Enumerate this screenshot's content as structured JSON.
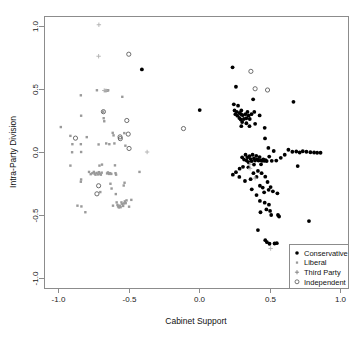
{
  "chart_data": {
    "type": "scatter",
    "title": "",
    "xlabel": "Cabinet Support",
    "ylabel": "Intra-Party Division",
    "xlim": [
      -1.15,
      1.15
    ],
    "ylim": [
      -1.15,
      1.08
    ],
    "grid": false,
    "xticks": [
      -1.0,
      -0.5,
      0.0,
      0.5,
      1.0
    ],
    "xticklabels": [
      "-1.0",
      "-0.5",
      "0.0",
      "0.5",
      "1.0"
    ],
    "yticks": [
      1.0,
      0.5,
      0.0,
      -0.5,
      -1.0
    ],
    "yticklabels": [
      "1.0",
      "0.5",
      "0.0",
      "-0.5",
      "-1.0"
    ],
    "legend_position": "lower right",
    "series": [
      {
        "name": "Conservative",
        "marker": "filled-circle",
        "color": "#000000",
        "points": [
          [
            -0.405,
            0.655
          ],
          [
            0.005,
            0.333
          ],
          [
            0.238,
            0.672
          ],
          [
            0.262,
            0.518
          ],
          [
            0.247,
            0.378
          ],
          [
            0.277,
            0.368
          ],
          [
            0.252,
            0.33
          ],
          [
            0.268,
            0.318
          ],
          [
            0.258,
            0.3
          ],
          [
            0.272,
            0.288
          ],
          [
            0.288,
            0.31
          ],
          [
            0.3,
            0.33
          ],
          [
            0.298,
            0.3
          ],
          [
            0.286,
            0.27
          ],
          [
            0.296,
            0.258
          ],
          [
            0.31,
            0.292
          ],
          [
            0.318,
            0.262
          ],
          [
            0.306,
            0.238
          ],
          [
            0.33,
            0.3
          ],
          [
            0.344,
            0.318
          ],
          [
            0.352,
            0.288
          ],
          [
            0.336,
            0.268
          ],
          [
            0.36,
            0.262
          ],
          [
            0.372,
            0.3
          ],
          [
            0.384,
            0.418
          ],
          [
            0.392,
            0.318
          ],
          [
            0.3,
            0.205
          ],
          [
            0.336,
            0.228
          ],
          [
            0.358,
            0.205
          ],
          [
            0.398,
            0.224
          ],
          [
            0.43,
            0.29
          ],
          [
            0.466,
            0.192
          ],
          [
            0.67,
            0.398
          ],
          [
            0.468,
            0.108
          ],
          [
            0.492,
            0.032
          ],
          [
            0.53,
            0.008
          ],
          [
            0.262,
            -0.16
          ],
          [
            0.24,
            -0.18
          ],
          [
            0.288,
            -0.132
          ],
          [
            0.306,
            -0.042
          ],
          [
            0.32,
            -0.06
          ],
          [
            0.33,
            -0.022
          ],
          [
            0.344,
            -0.042
          ],
          [
            0.338,
            -0.068
          ],
          [
            0.352,
            -0.082
          ],
          [
            0.358,
            -0.032
          ],
          [
            0.366,
            -0.056
          ],
          [
            0.374,
            -0.072
          ],
          [
            0.38,
            -0.022
          ],
          [
            0.39,
            -0.05
          ],
          [
            0.398,
            -0.068
          ],
          [
            0.406,
            -0.03
          ],
          [
            0.414,
            -0.058
          ],
          [
            0.422,
            -0.068
          ],
          [
            0.43,
            -0.04
          ],
          [
            0.44,
            -0.066
          ],
          [
            0.448,
            -0.07
          ],
          [
            0.456,
            -0.058
          ],
          [
            0.464,
            -0.07
          ],
          [
            0.472,
            -0.064
          ],
          [
            0.48,
            -0.072
          ],
          [
            0.312,
            -0.118
          ],
          [
            0.35,
            -0.122
          ],
          [
            0.39,
            -0.1
          ],
          [
            0.44,
            -0.098
          ],
          [
            0.498,
            -0.036
          ],
          [
            0.516,
            -0.07
          ],
          [
            0.548,
            -0.068
          ],
          [
            0.58,
            -0.046
          ],
          [
            0.608,
            -0.022
          ],
          [
            0.634,
            0.018
          ],
          [
            0.662,
            0.002
          ],
          [
            0.69,
            0.004
          ],
          [
            0.714,
            -0.004
          ],
          [
            0.736,
            0.006
          ],
          [
            0.762,
            0.002
          ],
          [
            0.79,
            -0.002
          ],
          [
            0.816,
            -0.004
          ],
          [
            0.838,
            -0.006
          ],
          [
            0.862,
            -0.006
          ],
          [
            0.7,
            -0.112
          ],
          [
            0.286,
            -0.198
          ],
          [
            0.326,
            -0.23
          ],
          [
            0.366,
            -0.216
          ],
          [
            0.386,
            -0.168
          ],
          [
            0.408,
            -0.198
          ],
          [
            0.418,
            -0.15
          ],
          [
            0.444,
            -0.168
          ],
          [
            0.47,
            -0.196
          ],
          [
            0.486,
            -0.238
          ],
          [
            0.432,
            -0.268
          ],
          [
            0.452,
            -0.282
          ],
          [
            0.462,
            -0.32
          ],
          [
            0.494,
            -0.3
          ],
          [
            0.508,
            -0.278
          ],
          [
            0.524,
            -0.312
          ],
          [
            0.556,
            -0.328
          ],
          [
            0.408,
            -0.342
          ],
          [
            0.374,
            -0.296
          ],
          [
            0.432,
            -0.388
          ],
          [
            0.466,
            -0.402
          ],
          [
            0.496,
            -0.418
          ],
          [
            0.478,
            -0.456
          ],
          [
            0.436,
            -0.478
          ],
          [
            0.504,
            -0.468
          ],
          [
            0.512,
            -0.5
          ],
          [
            0.56,
            -0.5
          ],
          [
            0.568,
            -0.512
          ],
          [
            0.78,
            -0.548
          ],
          [
            0.418,
            -0.62
          ],
          [
            0.47,
            -0.7
          ],
          [
            0.482,
            -0.716
          ],
          [
            0.5,
            -0.728
          ],
          [
            0.536,
            -0.726
          ],
          [
            0.552,
            -0.724
          ]
        ]
      },
      {
        "name": "Liberal",
        "marker": "small-square",
        "color": "#9a9a9a",
        "points": [
          [
            -0.98,
            0.198
          ],
          [
            -0.912,
            0.128
          ],
          [
            -0.898,
            0.062
          ],
          [
            -0.9,
            -0.002
          ],
          [
            -0.912,
            -0.108
          ],
          [
            -0.838,
            0.45
          ],
          [
            -0.836,
            0.288
          ],
          [
            -0.838,
            0.062
          ],
          [
            -0.836,
            0.0
          ],
          [
            -0.836,
            -0.218
          ],
          [
            -0.838,
            -0.236
          ],
          [
            -0.862,
            -0.426
          ],
          [
            -0.834,
            -0.432
          ],
          [
            -0.806,
            -0.478
          ],
          [
            -0.796,
            0.118
          ],
          [
            -0.78,
            -0.158
          ],
          [
            -0.768,
            -0.176
          ],
          [
            -0.756,
            -0.168
          ],
          [
            -0.746,
            -0.158
          ],
          [
            -0.74,
            -0.172
          ],
          [
            -0.734,
            -0.18
          ],
          [
            -0.726,
            -0.166
          ],
          [
            -0.716,
            -0.178
          ],
          [
            -0.71,
            -0.16
          ],
          [
            -0.704,
            -0.172
          ],
          [
            -0.696,
            -0.18
          ],
          [
            -0.69,
            -0.164
          ],
          [
            -0.724,
            0.49
          ],
          [
            -0.712,
            0.06
          ],
          [
            -0.706,
            -0.108
          ],
          [
            -0.7,
            -0.318
          ],
          [
            -0.688,
            -0.1
          ],
          [
            -0.68,
            0.32
          ],
          [
            -0.676,
            0.268
          ],
          [
            -0.672,
            0.244
          ],
          [
            -0.666,
            0.486
          ],
          [
            -0.656,
            0.488
          ],
          [
            -0.65,
            0.486
          ],
          [
            -0.644,
            0.49
          ],
          [
            -0.658,
            0.068
          ],
          [
            -0.652,
            -0.17
          ],
          [
            -0.646,
            -0.162
          ],
          [
            -0.638,
            -0.174
          ],
          [
            -0.63,
            -0.168
          ],
          [
            -0.622,
            -0.174
          ],
          [
            -0.636,
            0.062
          ],
          [
            -0.628,
            -0.252
          ],
          [
            -0.62,
            -0.29
          ],
          [
            -0.612,
            0.152
          ],
          [
            -0.606,
            0.132
          ],
          [
            -0.6,
            0.068
          ],
          [
            -0.596,
            -0.106
          ],
          [
            -0.592,
            -0.168
          ],
          [
            -0.588,
            -0.18
          ],
          [
            -0.584,
            -0.4
          ],
          [
            -0.578,
            -0.42
          ],
          [
            -0.574,
            -0.432
          ],
          [
            -0.568,
            -0.44
          ],
          [
            -0.562,
            -0.426
          ],
          [
            -0.556,
            -0.438
          ],
          [
            -0.55,
            -0.4
          ],
          [
            -0.544,
            -0.414
          ],
          [
            -0.538,
            -0.428
          ],
          [
            -0.532,
            -0.408
          ],
          [
            -0.526,
            -0.392
          ],
          [
            -0.52,
            -0.406
          ],
          [
            -0.514,
            -0.384
          ],
          [
            -0.534,
            -0.266
          ],
          [
            -0.528,
            -0.244
          ],
          [
            -0.544,
            0.438
          ],
          [
            -0.53,
            0.15
          ],
          [
            -0.522,
            0.05
          ],
          [
            -0.59,
            -0.334
          ],
          [
            -0.61,
            -0.426
          ],
          [
            -0.48,
            -0.38
          ],
          [
            -0.496,
            -0.434
          ],
          [
            -0.422,
            -0.158
          ]
        ]
      },
      {
        "name": "Third Party",
        "marker": "plus",
        "color": "#b0b0b0",
        "points": [
          [
            -0.71,
            1.01
          ],
          [
            -0.712,
            0.76
          ],
          [
            -0.672,
            0.488
          ],
          [
            -0.66,
            0.486
          ],
          [
            -0.368,
            0.0
          ],
          [
            0.36,
            -0.098
          ],
          [
            0.362,
            -0.13
          ],
          [
            0.398,
            -0.208
          ],
          [
            0.508,
            -0.766
          ]
        ]
      },
      {
        "name": "Independent",
        "marker": "open-circle",
        "color": "#555555",
        "points": [
          [
            -0.498,
            0.776
          ],
          [
            0.368,
            0.64
          ],
          [
            0.398,
            0.502
          ],
          [
            0.486,
            0.492
          ],
          [
            -0.876,
            0.11
          ],
          [
            -0.678,
            0.32
          ],
          [
            -0.512,
            0.25
          ],
          [
            -0.502,
            0.142
          ],
          [
            -0.496,
            0.028
          ],
          [
            -0.558,
            0.106
          ],
          [
            -0.56,
            0.12
          ],
          [
            -0.712,
            -0.268
          ],
          [
            -0.724,
            -0.332
          ],
          [
            -0.11,
            0.186
          ]
        ]
      }
    ]
  },
  "legend": {
    "items": [
      {
        "label": "Conservative",
        "marker": "filled-circle"
      },
      {
        "label": "Liberal",
        "marker": "small-square"
      },
      {
        "label": "Third Party",
        "marker": "plus"
      },
      {
        "label": "Independent",
        "marker": "open-circle"
      }
    ]
  }
}
